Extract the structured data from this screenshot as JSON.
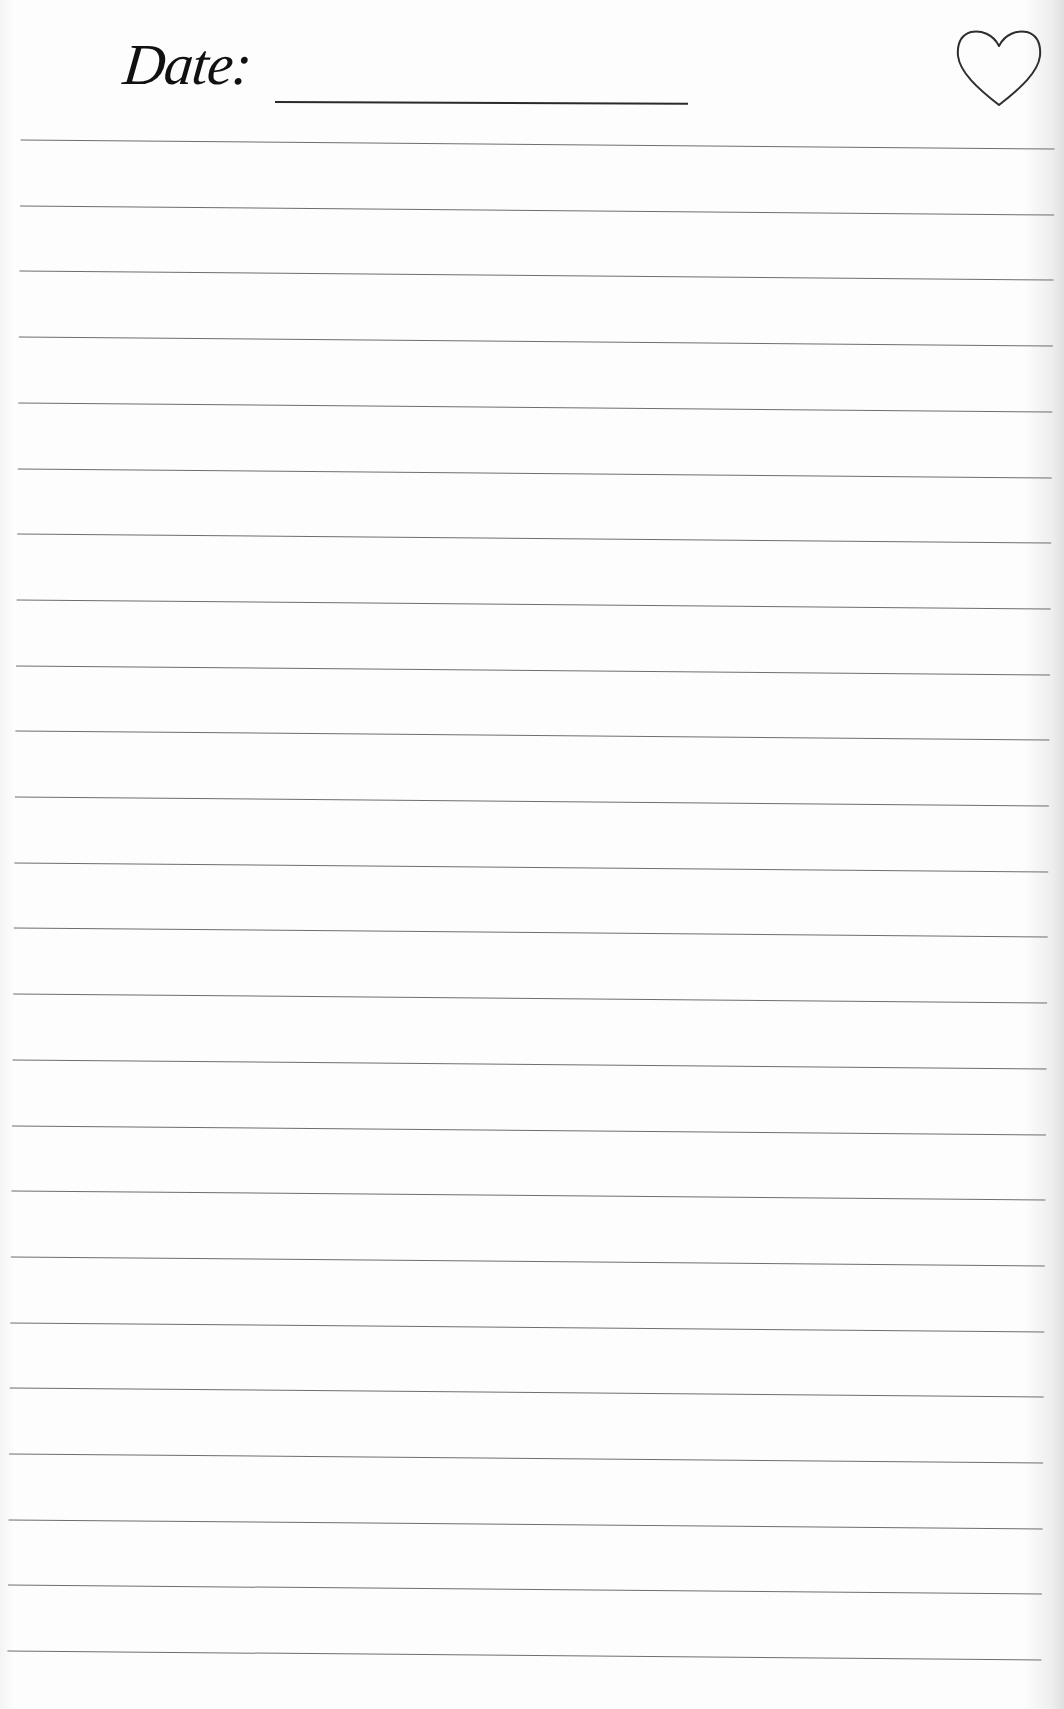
{
  "page": {
    "type": "lined-notebook-page",
    "background": "#fdfdfd",
    "line_color": "#6e6e6e"
  },
  "header": {
    "date_label": "Date:",
    "date_value": "",
    "favorite_icon": "heart-outline-icon"
  },
  "rules": {
    "count": 24,
    "first_line_y": 145,
    "spacing_px": 65.7
  }
}
